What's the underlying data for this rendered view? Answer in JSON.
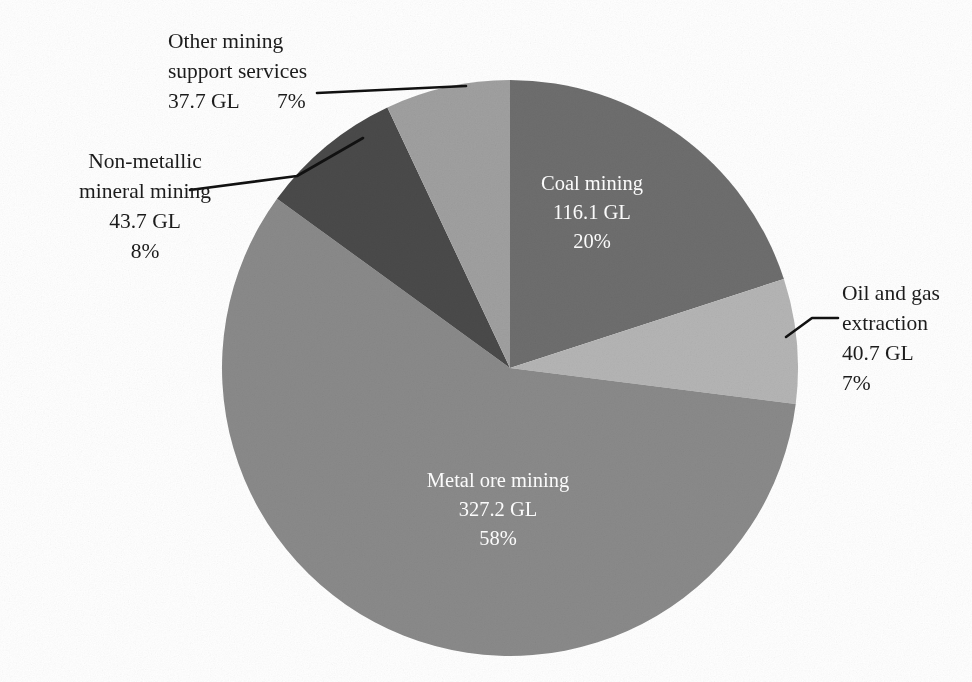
{
  "chart_data": {
    "type": "pie",
    "title": "",
    "subtitle": "",
    "xlabel": "",
    "ylabel": "",
    "unit": "GL",
    "legend_position": "none",
    "grid": false,
    "total_value": 565.4,
    "categories": [
      "Coal mining",
      "Oil and gas extraction",
      "Metal ore mining",
      "Non-metallic mineral mining",
      "Other mining support services"
    ],
    "values": [
      116.1,
      40.7,
      327.2,
      43.7,
      37.7
    ],
    "percentages": [
      20,
      7,
      58,
      8,
      7
    ],
    "colors": [
      "#6e6e6e",
      "#b5b5b5",
      "#8a8a8a",
      "#4a4a4a",
      "#a0a0a0"
    ],
    "start_angle_deg": 0,
    "direction": "clockwise",
    "slices": [
      {
        "label": "Coal mining",
        "value_text": "116.1 GL",
        "percent_text": "20%",
        "value": 116.1,
        "percent": 20,
        "color": "#6e6e6e",
        "label_placement": "inside",
        "text_color": "#ffffff"
      },
      {
        "label": "Oil and gas extraction",
        "label_line1": "Oil and gas",
        "label_line2": "extraction",
        "value_text": "40.7 GL",
        "percent_text": "7%",
        "value": 40.7,
        "percent": 7,
        "color": "#b5b5b5",
        "label_placement": "outside-right",
        "text_color": "#1c1c1c"
      },
      {
        "label": "Metal ore mining",
        "value_text": "327.2 GL",
        "percent_text": "58%",
        "value": 327.2,
        "percent": 58,
        "color": "#8a8a8a",
        "label_placement": "inside",
        "text_color": "#ffffff"
      },
      {
        "label": "Non-metallic mineral mining",
        "label_line1": "Non-metallic",
        "label_line2": "mineral mining",
        "value_text": "43.7 GL",
        "percent_text": "8%",
        "value": 43.7,
        "percent": 8,
        "color": "#4a4a4a",
        "label_placement": "outside-left",
        "text_color": "#1c1c1c"
      },
      {
        "label": "Other mining support services",
        "label_line1": "Other mining",
        "label_line2": "support services",
        "value_text": "37.7 GL",
        "percent_text": "7%",
        "value": 37.7,
        "percent": 7,
        "color": "#a0a0a0",
        "label_placement": "outside-top-left",
        "text_color": "#1c1c1c"
      }
    ],
    "geometry": {
      "center_x": 510,
      "center_y": 368,
      "radius": 288
    }
  },
  "callouts": {
    "other_mining": {
      "line1": "Other mining",
      "line2": "support services",
      "line3": "37.7 GL",
      "percent": "7%"
    },
    "non_metallic": {
      "line1": "Non-metallic",
      "line2": "mineral mining",
      "line3": "43.7 GL",
      "line4": "8%"
    },
    "oil_gas": {
      "line1": "Oil and gas",
      "line2": "extraction",
      "line3": "40.7 GL",
      "line4": "7%"
    }
  },
  "inside_labels": {
    "coal": {
      "line1": "Coal mining",
      "line2": "116.1 GL",
      "line3": "20%"
    },
    "metal_ore": {
      "line1": "Metal ore mining",
      "line2": "327.2 GL",
      "line3": "58%"
    }
  }
}
